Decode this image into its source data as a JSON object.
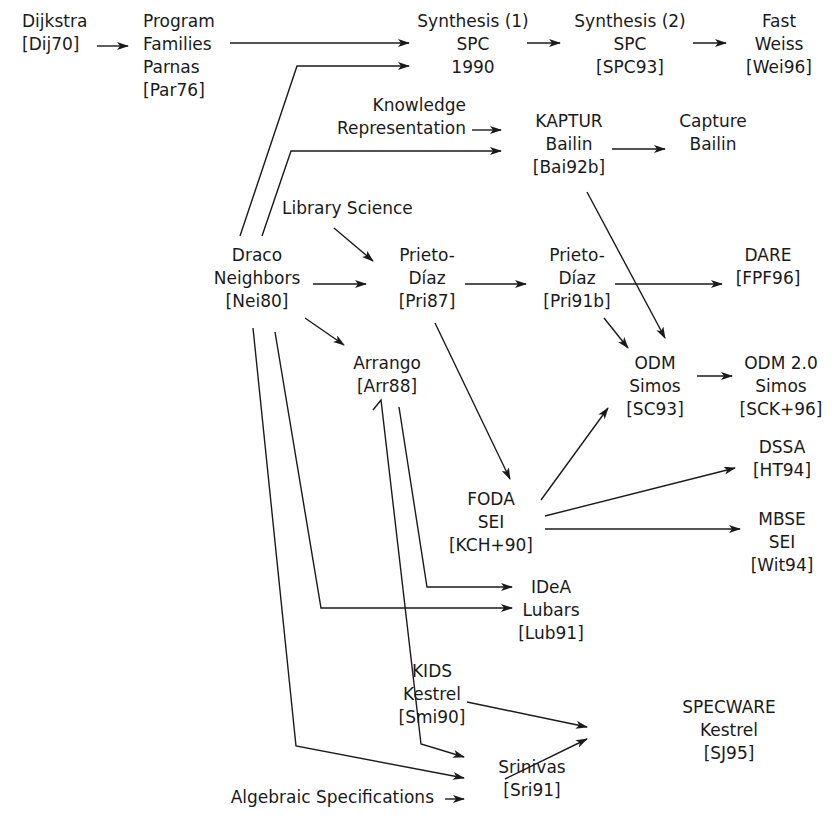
{
  "diagram": {
    "type": "flow",
    "edge_color": "#1a1a1a",
    "nodes": [
      {
        "id": "dijkstra",
        "lines": [
          "Dijkstra",
          "[Dij70]"
        ],
        "x": 22,
        "y": 10,
        "align": "left"
      },
      {
        "id": "program-families",
        "lines": [
          "Program",
          "Families",
          "Parnas",
          "[Par76]"
        ],
        "x": 143,
        "y": 10,
        "align": "left"
      },
      {
        "id": "synthesis-1",
        "lines": [
          "Synthesis (1)",
          "SPC",
          "1990"
        ],
        "x": 473,
        "y": 10,
        "align": "center"
      },
      {
        "id": "synthesis-2",
        "lines": [
          "Synthesis (2)",
          "SPC",
          "[SPC93]"
        ],
        "x": 630,
        "y": 10,
        "align": "center"
      },
      {
        "id": "fast",
        "lines": [
          "Fast",
          "Weiss",
          "[Wei96]"
        ],
        "x": 779,
        "y": 10,
        "align": "center"
      },
      {
        "id": "knowledge-representation",
        "lines": [
          "Knowledge",
          "Representation"
        ],
        "x": 466,
        "y": 94,
        "align": "right"
      },
      {
        "id": "kaptur",
        "lines": [
          "KAPTUR",
          "Bailin",
          "[Bai92b]"
        ],
        "x": 569,
        "y": 110,
        "align": "center"
      },
      {
        "id": "capture",
        "lines": [
          "Capture",
          "Bailin"
        ],
        "x": 713,
        "y": 110,
        "align": "center"
      },
      {
        "id": "library-science",
        "lines": [
          "Library Science"
        ],
        "x": 282,
        "y": 197,
        "align": "left"
      },
      {
        "id": "draco",
        "lines": [
          "Draco",
          "Neighbors",
          "[Nei80]"
        ],
        "x": 257,
        "y": 244,
        "align": "center"
      },
      {
        "id": "prieto-diaz-87",
        "lines": [
          "Prieto-",
          "Díaz",
          "[Pri87]"
        ],
        "x": 427,
        "y": 244,
        "align": "center"
      },
      {
        "id": "prieto-diaz-91b",
        "lines": [
          "Prieto-",
          "Díaz",
          "[Pri91b]"
        ],
        "x": 577,
        "y": 244,
        "align": "center"
      },
      {
        "id": "dare",
        "lines": [
          "DARE",
          "[FPF96]"
        ],
        "x": 768,
        "y": 244,
        "align": "center"
      },
      {
        "id": "arrango",
        "lines": [
          "Arrango",
          "[Arr88]"
        ],
        "x": 387,
        "y": 352,
        "align": "center"
      },
      {
        "id": "odm",
        "lines": [
          "ODM",
          "Simos",
          "[SC93]"
        ],
        "x": 655,
        "y": 352,
        "align": "center"
      },
      {
        "id": "odm-2",
        "lines": [
          "ODM 2.0",
          "Simos",
          "[SCK+96]"
        ],
        "x": 781,
        "y": 352,
        "align": "center"
      },
      {
        "id": "dssa",
        "lines": [
          "DSSA",
          "[HT94]"
        ],
        "x": 782,
        "y": 436,
        "align": "center"
      },
      {
        "id": "foda",
        "lines": [
          "FODA",
          "SEI",
          "[KCH+90]"
        ],
        "x": 491,
        "y": 488,
        "align": "center"
      },
      {
        "id": "mbse",
        "lines": [
          "MBSE",
          "SEI",
          "[Wit94]"
        ],
        "x": 782,
        "y": 508,
        "align": "center"
      },
      {
        "id": "idea",
        "lines": [
          "IDeA",
          "Lubars",
          "[Lub91]"
        ],
        "x": 551,
        "y": 576,
        "align": "center"
      },
      {
        "id": "kids",
        "lines": [
          "KIDS",
          "Kestrel",
          "[Smi90]"
        ],
        "x": 432,
        "y": 660,
        "align": "center"
      },
      {
        "id": "specware",
        "lines": [
          "SPECWARE",
          "Kestrel",
          "[SJ95]"
        ],
        "x": 729,
        "y": 696,
        "align": "center"
      },
      {
        "id": "srinivas",
        "lines": [
          "Srinivas",
          "[Sri91]"
        ],
        "x": 532,
        "y": 756,
        "align": "center"
      },
      {
        "id": "algebraic-specifications",
        "lines": [
          "Algebraic Specifications"
        ],
        "x": 434,
        "y": 786,
        "align": "right"
      }
    ],
    "edges": [
      {
        "from": "dijkstra",
        "to": "program-families",
        "points": [
          [
            97,
            46
          ],
          [
            128,
            46
          ]
        ]
      },
      {
        "from": "program-families",
        "to": "synthesis-1",
        "points": [
          [
            230,
            43
          ],
          [
            409,
            43
          ]
        ]
      },
      {
        "from": "draco",
        "to": "synthesis-1",
        "points": [
          [
            240,
            236
          ],
          [
            297,
            66
          ],
          [
            409,
            66
          ]
        ]
      },
      {
        "from": "synthesis-1",
        "to": "synthesis-2",
        "points": [
          [
            527,
            43
          ],
          [
            560,
            43
          ]
        ]
      },
      {
        "from": "synthesis-2",
        "to": "fast",
        "points": [
          [
            693,
            43
          ],
          [
            726,
            43
          ]
        ]
      },
      {
        "from": "knowledge-representation",
        "to": "kaptur",
        "points": [
          [
            472,
            130
          ],
          [
            501,
            130
          ]
        ]
      },
      {
        "from": "draco",
        "to": "kaptur",
        "points": [
          [
            262,
            236
          ],
          [
            291,
            151
          ],
          [
            501,
            151
          ]
        ]
      },
      {
        "from": "kaptur",
        "to": "capture",
        "points": [
          [
            612,
            149
          ],
          [
            665,
            149
          ]
        ]
      },
      {
        "from": "library-science",
        "to": "prieto-diaz-87",
        "points": [
          [
            334,
            228
          ],
          [
            373,
            261
          ]
        ]
      },
      {
        "from": "draco",
        "to": "prieto-diaz-87",
        "points": [
          [
            313,
            284
          ],
          [
            366,
            284
          ]
        ]
      },
      {
        "from": "prieto-diaz-87",
        "to": "prieto-diaz-91b",
        "points": [
          [
            465,
            284
          ],
          [
            526,
            284
          ]
        ]
      },
      {
        "from": "prieto-diaz-91b",
        "to": "dare",
        "points": [
          [
            615,
            284
          ],
          [
            722,
            284
          ]
        ]
      },
      {
        "from": "kaptur",
        "to": "odm",
        "points": [
          [
            587,
            192
          ],
          [
            665,
            338
          ]
        ]
      },
      {
        "from": "prieto-diaz-91b",
        "to": "odm",
        "points": [
          [
            604,
            318
          ],
          [
            628,
            348
          ]
        ]
      },
      {
        "from": "draco",
        "to": "arrango",
        "points": [
          [
            305,
            318
          ],
          [
            344,
            345
          ]
        ]
      },
      {
        "from": "odm",
        "to": "odm-2",
        "points": [
          [
            697,
            376
          ],
          [
            732,
            376
          ]
        ]
      },
      {
        "from": "prieto-diaz-87",
        "to": "foda",
        "points": [
          [
            435,
            323
          ],
          [
            510,
            479
          ]
        ]
      },
      {
        "from": "foda",
        "to": "odm",
        "points": [
          [
            541,
            500
          ],
          [
            608,
            408
          ]
        ]
      },
      {
        "from": "foda",
        "to": "dssa",
        "points": [
          [
            545,
            516
          ],
          [
            735,
            468
          ]
        ]
      },
      {
        "from": "foda",
        "to": "mbse",
        "points": [
          [
            545,
            529
          ],
          [
            740,
            529
          ]
        ]
      },
      {
        "from": "arrango",
        "to": "idea",
        "points": [
          [
            399,
            407
          ],
          [
            427,
            587
          ],
          [
            512,
            587
          ]
        ]
      },
      {
        "from": "draco",
        "to": "idea",
        "points": [
          [
            275,
            332
          ],
          [
            321,
            608
          ],
          [
            512,
            608
          ]
        ]
      },
      {
        "from": "kids",
        "to": "specware",
        "points": [
          [
            467,
            702
          ],
          [
            587,
            727
          ]
        ]
      },
      {
        "from": "arrango",
        "to": "srinivas",
        "points": [
          [
            373,
            410
          ],
          [
            381,
            400
          ],
          [
            421,
            744
          ],
          [
            464,
            757
          ]
        ]
      },
      {
        "from": "draco",
        "to": "srinivas",
        "points": [
          [
            253,
            328
          ],
          [
            296,
            746
          ],
          [
            464,
            778
          ]
        ]
      },
      {
        "from": "algebraic-specifications",
        "to": "srinivas",
        "points": [
          [
            445,
            799
          ],
          [
            464,
            799
          ]
        ]
      },
      {
        "from": "srinivas",
        "to": "specware",
        "points": [
          [
            505,
            779
          ],
          [
            587,
            739
          ]
        ]
      }
    ]
  }
}
